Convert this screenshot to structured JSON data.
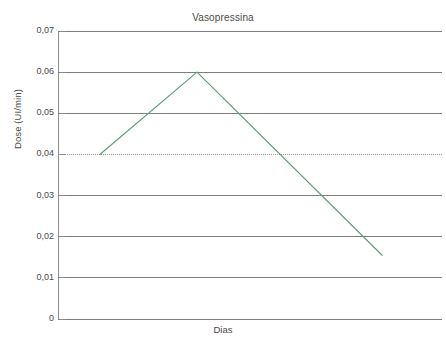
{
  "figure": {
    "title": "Vasopressina",
    "background_color": "#ffffff",
    "line_color": "#5f9e7d",
    "grid_color": "#7d7d7d",
    "text_color": "#4a4a4a"
  },
  "chart_data": {
    "type": "line",
    "title": "Vasopressina",
    "subtitle": "",
    "xlabel": "Dias",
    "ylabel": "Dose (UI/min)",
    "ylim": [
      0,
      0.07
    ],
    "xlim": [
      0,
      1
    ],
    "grid": true,
    "legend": false,
    "legend_position": "none",
    "y_tick_labels": [
      "0,07",
      "0,06",
      "0,05",
      "0,04",
      "0,03",
      "0,02",
      "0,01",
      "0"
    ],
    "y_tick_values": [
      0.07,
      0.06,
      0.05,
      0.04,
      0.03,
      0.02,
      0.01,
      0
    ],
    "x_tick_labels": [],
    "x_tick_values": [],
    "reference_line": {
      "value": 0.04,
      "label": "0,04",
      "style": "dotted",
      "color": "#9b9b9b"
    },
    "series": [
      {
        "name": "Vasopressina",
        "color": "#5f9e7d",
        "style": "solid",
        "points": [
          {
            "x": 0.109,
            "y": 0.04
          },
          {
            "x": 0.362,
            "y": 0.06
          },
          {
            "x": 0.844,
            "y": 0.0155
          }
        ]
      }
    ],
    "annotations": []
  },
  "axes": {
    "y_title": "Dose (UI/min)",
    "x_title": "Dias",
    "y_ticks": [
      {
        "label": "0,07",
        "value": 0.07
      },
      {
        "label": "0,06",
        "value": 0.06
      },
      {
        "label": "0,05",
        "value": 0.05
      },
      {
        "label": "0,04",
        "value": 0.04
      },
      {
        "label": "0,03",
        "value": 0.03
      },
      {
        "label": "0,02",
        "value": 0.02
      },
      {
        "label": "0,01",
        "value": 0.01
      },
      {
        "label": "0",
        "value": 0
      }
    ]
  }
}
